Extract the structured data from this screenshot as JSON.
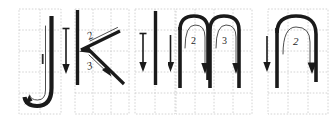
{
  "figure": {
    "kind": "stroke-order-diagram",
    "title": "",
    "background_color": "#ffffff",
    "ink_color": "#1a1a1a",
    "grid_color": "#c9c9c9",
    "panel_count": 5
  },
  "panels": [
    {
      "id": "panel-1",
      "name": "hook-stroke-panel",
      "grid_cols": 2,
      "grid_rows": 5,
      "strokes": [
        {
          "order_label": "1",
          "show_label": false,
          "shape": "vertical-with-left-hook",
          "direction": "down-then-left"
        }
      ],
      "guide_arrows": [
        {
          "label": "1",
          "show_label": false,
          "direction": "down"
        }
      ]
    },
    {
      "id": "panel-2",
      "name": "vertical-and-two-diagonals-panel",
      "grid_cols": 3,
      "grid_rows": 5,
      "strokes": [
        {
          "order_label": "1",
          "show_label": false,
          "shape": "vertical",
          "direction": "down"
        },
        {
          "order_label": "2",
          "show_label": true,
          "shape": "diagonal",
          "direction": "down-left"
        },
        {
          "order_label": "3",
          "show_label": true,
          "shape": "diagonal",
          "direction": "down-right"
        }
      ],
      "guide_arrows": [
        {
          "label": "1",
          "show_label": true,
          "direction": "down"
        }
      ]
    },
    {
      "id": "panel-3",
      "name": "single-vertical-panel",
      "grid_cols": 2,
      "grid_rows": 5,
      "strokes": [
        {
          "order_label": "1",
          "show_label": false,
          "shape": "vertical",
          "direction": "down"
        }
      ],
      "guide_arrows": [
        {
          "label": "1",
          "show_label": true,
          "direction": "down"
        }
      ]
    },
    {
      "id": "panel-4",
      "name": "double-arch-panel",
      "grid_cols": 4,
      "grid_rows": 5,
      "strokes": [
        {
          "order_label": "1",
          "show_label": false,
          "shape": "vertical",
          "direction": "down"
        },
        {
          "order_label": "2",
          "show_label": true,
          "shape": "arch",
          "direction": "up-over-down"
        },
        {
          "order_label": "3",
          "show_label": true,
          "shape": "arch",
          "direction": "up-over-down"
        }
      ],
      "guide_arrows": [
        {
          "label": "1",
          "show_label": true,
          "direction": "down"
        }
      ]
    },
    {
      "id": "panel-5",
      "name": "single-arch-panel",
      "grid_cols": 3,
      "grid_rows": 5,
      "strokes": [
        {
          "order_label": "1",
          "show_label": false,
          "shape": "vertical",
          "direction": "down"
        },
        {
          "order_label": "2",
          "show_label": true,
          "shape": "arch",
          "direction": "up-over-down"
        }
      ],
      "guide_arrows": [
        {
          "label": "1",
          "show_label": true,
          "direction": "down"
        }
      ]
    }
  ],
  "labels": {
    "p2_stroke2": "2",
    "p2_stroke3": "3",
    "p2_guide1": "1",
    "p3_guide1": "1",
    "p4_guide1": "1",
    "p4_stroke2": "2",
    "p4_stroke3": "3",
    "p5_guide1": "1",
    "p5_stroke2": "2"
  }
}
